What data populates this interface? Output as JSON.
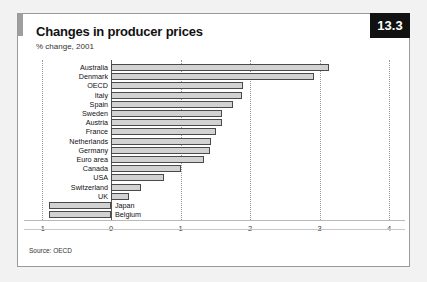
{
  "card": {
    "badge": "13.3",
    "title": "Changes in producer prices",
    "subtitle": "% change, 2001",
    "source": "Source: OECD"
  },
  "chart_data": {
    "type": "bar",
    "orientation": "horizontal",
    "title": "Changes in producer prices",
    "subtitle": "% change, 2001",
    "xlabel": "",
    "ylabel": "",
    "xlim": [
      -1,
      4
    ],
    "xticks": [
      -1,
      0,
      1,
      2,
      3,
      4
    ],
    "xticklabels": [
      "-1",
      "0",
      "1",
      "2",
      "3",
      "4"
    ],
    "grid": "vertical-dotted",
    "legend": "none",
    "bar_color": "#d2d2d2",
    "bar_edge_color": "#4a4a4a",
    "categories": [
      "Australia",
      "Denmark",
      "OECD",
      "Italy",
      "Spain",
      "Sweden",
      "Austria",
      "France",
      "Netherlands",
      "Germany",
      "Euro area",
      "Canada",
      "USA",
      "Switzerland",
      "UK",
      "Japan",
      "Belgium"
    ],
    "values": [
      3.14,
      2.92,
      1.9,
      1.89,
      1.76,
      1.6,
      1.59,
      1.51,
      1.44,
      1.43,
      1.34,
      1.0,
      0.76,
      0.43,
      0.26,
      -0.89,
      -0.89
    ],
    "source": "Source: OECD"
  }
}
